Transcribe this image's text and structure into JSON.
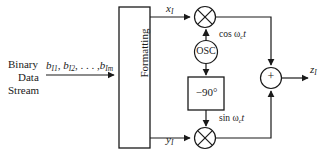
{
  "diagram": {
    "stroke_color": "#1a1a1a",
    "fill_color": "#ffffff",
    "source": {
      "line1": "Binary",
      "line2": "Data",
      "line3": "Stream"
    },
    "input_signal": {
      "name": "bit-sequence",
      "base": "b",
      "terms": [
        "b",
        "b",
        "b"
      ],
      "subscripts": [
        "I1",
        "I2",
        "Im"
      ],
      "ellipsis": ", . . . ,"
    },
    "blocks": {
      "formatting": {
        "label": "Formatting",
        "orientation": "vertical"
      },
      "oscillator": {
        "label": "OSC",
        "shape": "circle"
      },
      "phase_shift": {
        "label": "−90°",
        "shape": "rect"
      }
    },
    "mixers": {
      "upper": {
        "name": "multiplier-upper",
        "glyph": "⊗"
      },
      "lower": {
        "name": "multiplier-lower",
        "glyph": "⊗"
      }
    },
    "summer": {
      "label": "+",
      "shape": "circle"
    },
    "signals": {
      "x_t": {
        "base": "x",
        "sub": "I"
      },
      "y_t": {
        "base": "y",
        "sub": "I"
      },
      "z_t": {
        "base": "z",
        "sub": "I"
      },
      "carrier_cos": {
        "prefix": "cos ",
        "omega": "ω",
        "sub": "c",
        "var": "t"
      },
      "carrier_sin": {
        "prefix": "sin ",
        "omega": "ω",
        "sub": "c",
        "var": "t"
      }
    }
  }
}
